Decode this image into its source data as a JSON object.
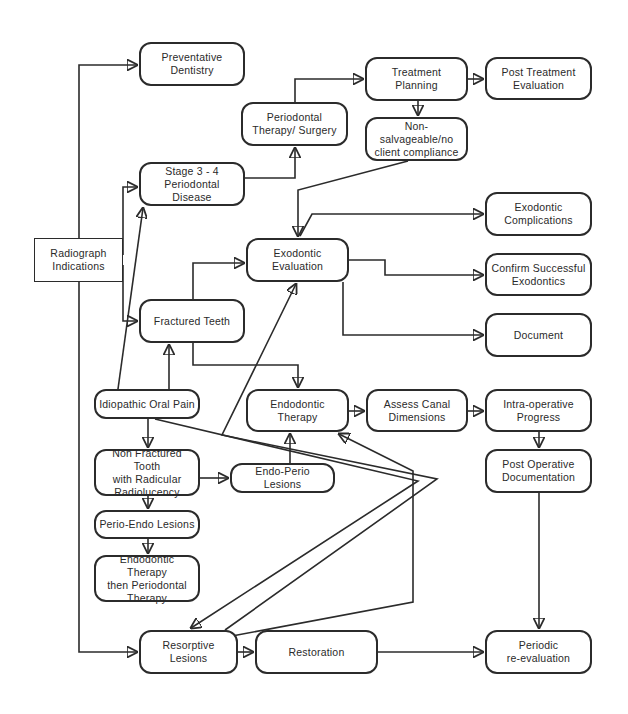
{
  "diagram": {
    "type": "flowchart",
    "nodes": {
      "preventative": "Preventative\nDentistry",
      "radiograph": "Radiograph\nIndications",
      "stage34": "Stage 3 - 4\nPeriodontal Disease",
      "perio_therapy": "Periodontal\nTherapy/  Surgery",
      "treatment_planning": "Treatment Planning",
      "post_treatment": "Post Treatment\nEvaluation",
      "non_salvageable": "Non-salvageable/no\nclient compliance",
      "exodontic_eval": "Exodontic\nEvaluation",
      "exodontic_complications": "Exodontic\nComplications",
      "confirm_exodontics": "Confirm Successful\nExodontics",
      "document": "Document",
      "fractured_teeth": "Fractured Teeth",
      "idiopathic": "Idiopathic Oral Pain",
      "endo_therapy": "Endodontic Therapy",
      "assess_canal": "Assess Canal\nDimensions",
      "intra_op": "Intra-operative\nProgress",
      "post_op_doc": "Post Operative\nDocumentation",
      "non_fractured": "Non Fractured Tooth\nwith Radicular\nRadiolucency",
      "endo_perio": "Endo-Perio Lesions",
      "perio_endo": "Perio-Endo Lesions",
      "endo_then_perio": "Endodontic Therapy\nthen Periodontal\nTherapy",
      "resorptive": "Resorptive\nLesions",
      "restoration": "Restoration",
      "periodic_reeval": "Periodic\nre-evaluation"
    },
    "edges": [
      {
        "from": "Radiograph Indications",
        "to": "Preventative Dentistry"
      },
      {
        "from": "Radiograph Indications",
        "to": "Stage 3 - 4 Periodontal Disease"
      },
      {
        "from": "Radiograph Indications",
        "to": "Fractured Teeth"
      },
      {
        "from": "Radiograph Indications",
        "to": "Resorptive Lesions"
      },
      {
        "from": "Stage 3 - 4 Periodontal Disease",
        "to": "Periodontal Therapy/ Surgery"
      },
      {
        "from": "Periodontal Therapy/ Surgery",
        "to": "Treatment Planning"
      },
      {
        "from": "Treatment Planning",
        "to": "Post Treatment Evaluation"
      },
      {
        "from": "Treatment Planning",
        "to": "Non-salvageable/no client compliance"
      },
      {
        "from": "Non-salvageable/no client compliance",
        "to": "Exodontic Evaluation"
      },
      {
        "from": "Exodontic Evaluation",
        "to": "Exodontic Complications"
      },
      {
        "from": "Exodontic Evaluation",
        "to": "Confirm Successful Exodontics"
      },
      {
        "from": "Exodontic Evaluation",
        "to": "Document"
      },
      {
        "from": "Fractured Teeth",
        "to": "Exodontic Evaluation"
      },
      {
        "from": "Fractured Teeth",
        "to": "Endodontic Therapy"
      },
      {
        "from": "Idiopathic Oral Pain",
        "to": "Fractured Teeth"
      },
      {
        "from": "Idiopathic Oral Pain",
        "to": "Stage 3 - 4 Periodontal Disease"
      },
      {
        "from": "Idiopathic Oral Pain",
        "to": "Non Fractured Tooth with Radicular Radiolucency"
      },
      {
        "from": "Idiopathic Oral Pain",
        "to": "Resorptive Lesions"
      },
      {
        "from": "Non Fractured Tooth with Radicular Radiolucency",
        "to": "Endo-Perio Lesions"
      },
      {
        "from": "Non Fractured Tooth with Radicular Radiolucency",
        "to": "Perio-Endo Lesions"
      },
      {
        "from": "Perio-Endo Lesions",
        "to": "Endodontic Therapy then Periodontal Therapy"
      },
      {
        "from": "Endo-Perio Lesions",
        "to": "Endodontic Therapy"
      },
      {
        "from": "Endodontic Therapy",
        "to": "Assess Canal Dimensions"
      },
      {
        "from": "Assess Canal Dimensions",
        "to": "Intra-operative Progress"
      },
      {
        "from": "Intra-operative Progress",
        "to": "Post Operative Documentation"
      },
      {
        "from": "Post Operative Documentation",
        "to": "Periodic re-evaluation"
      },
      {
        "from": "Resorptive Lesions",
        "to": "Exodontic Evaluation"
      },
      {
        "from": "Resorptive Lesions",
        "to": "Endodontic Therapy"
      },
      {
        "from": "Resorptive Lesions",
        "to": "Restoration"
      },
      {
        "from": "Restoration",
        "to": "Periodic re-evaluation"
      }
    ]
  }
}
